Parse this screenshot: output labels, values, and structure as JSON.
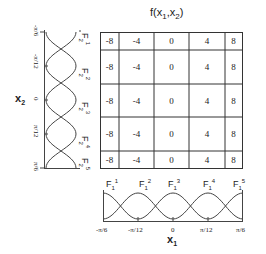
{
  "title": {
    "main": "f(x",
    "sub1": "1",
    "mid": ",x",
    "sub2": "2",
    "end": ")"
  },
  "grid": {
    "rows": [
      [
        "-8",
        "-4",
        "0",
        "4",
        "8"
      ],
      [
        "-8",
        "-4",
        "0",
        "4",
        "8"
      ],
      [
        "-8",
        "-4",
        "0",
        "4",
        "8"
      ],
      [
        "-8",
        "-4",
        "0",
        "4",
        "8"
      ],
      [
        "-8",
        "-4",
        "0",
        "4",
        "8"
      ]
    ]
  },
  "x1_axis": {
    "label": "x",
    "label_sub": "1",
    "ticks": [
      "-π/6",
      "-π/12",
      "0",
      "π/12",
      "π/6"
    ],
    "membership_labels": [
      {
        "base": "F",
        "sub": "1",
        "sup": "1"
      },
      {
        "base": "F",
        "sub": "1",
        "sup": "2"
      },
      {
        "base": "F",
        "sub": "1",
        "sup": "3"
      },
      {
        "base": "F",
        "sub": "1",
        "sup": "4"
      },
      {
        "base": "F",
        "sub": "1",
        "sup": "5"
      }
    ]
  },
  "x2_axis": {
    "label": "x",
    "label_sub": "2",
    "ticks": [
      "-π/6",
      "-π/12",
      "0",
      "π/12",
      "π/6"
    ],
    "membership_labels": [
      {
        "base": "F",
        "sub": "2",
        "sup": "1"
      },
      {
        "base": "F",
        "sub": "2",
        "sup": "2"
      },
      {
        "base": "F",
        "sub": "2",
        "sup": "3"
      },
      {
        "base": "F",
        "sub": "2",
        "sup": "4"
      },
      {
        "base": "F",
        "sub": "2",
        "sup": "5"
      }
    ]
  }
}
